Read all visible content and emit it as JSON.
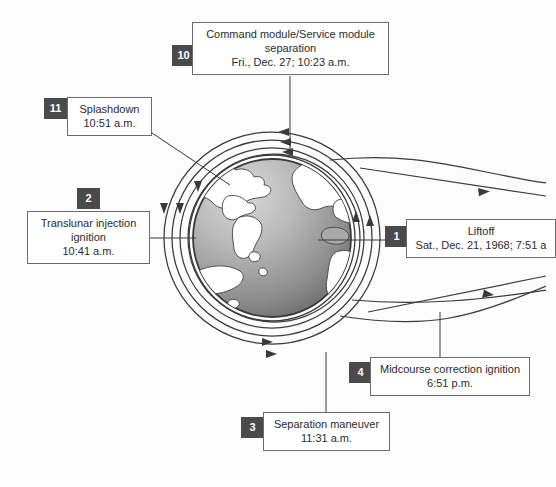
{
  "figure": {
    "background_color": "#fcfcfc",
    "badge_color": "#4a4a4a",
    "line_color": "#3a3a3a",
    "globe_ocean_light": "#c8c8c8",
    "globe_ocean_dark": "#6e6e6e",
    "globe_land_color": "#ffffff"
  },
  "globe": {
    "name": "earth-globe",
    "center_x": 272,
    "center_y": 238,
    "radius": 83
  },
  "orbits": [
    {
      "name": "orbit-arc-1",
      "arrow_direction": "left"
    },
    {
      "name": "orbit-arc-2",
      "arrow_direction": "left"
    },
    {
      "name": "orbit-arc-3",
      "arrow_direction": "left"
    },
    {
      "name": "orbit-arc-4",
      "arrow_direction": "down"
    },
    {
      "name": "orbit-arc-5",
      "arrow_direction": "down"
    },
    {
      "name": "orbit-arc-6",
      "arrow_direction": "right"
    },
    {
      "name": "orbit-arc-7",
      "arrow_direction": "right"
    },
    {
      "name": "orbit-arc-8",
      "arrow_direction": "up"
    },
    {
      "name": "orbit-arc-9",
      "arrow_direction": "up"
    }
  ],
  "callouts": [
    {
      "id": "10",
      "name": "callout-command-service-module-separation",
      "badge": "10",
      "lines": [
        "Command module/Service module",
        "separation",
        "Fri., Dec. 27; 10:23 a.m."
      ]
    },
    {
      "id": "11",
      "name": "callout-splashdown",
      "badge": "11",
      "lines": [
        "Splashdown",
        "10:51 a.m."
      ]
    },
    {
      "id": "2",
      "name": "callout-translunar-injection-ignition",
      "badge": "2",
      "lines": [
        "Translunar injection",
        "ignition",
        "10:41 a.m."
      ]
    },
    {
      "id": "1",
      "name": "callout-liftoff",
      "badge": "1",
      "lines": [
        "Liftoff",
        "Sat., Dec. 21, 1968; 7:51 a"
      ]
    },
    {
      "id": "4",
      "name": "callout-midcourse-correction-ignition",
      "badge": "4",
      "lines": [
        "Midcourse correction ignition",
        "6:51 p.m."
      ]
    },
    {
      "id": "3",
      "name": "callout-separation-maneuver",
      "badge": "3",
      "lines": [
        "Separation maneuver",
        "11:31 a.m."
      ]
    }
  ]
}
